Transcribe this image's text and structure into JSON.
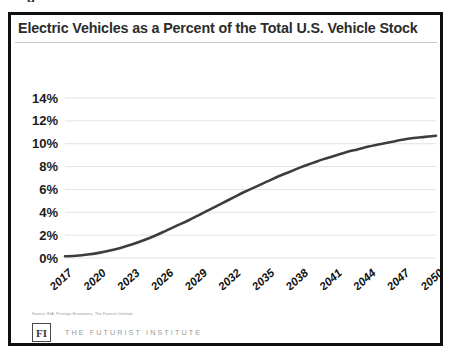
{
  "figure": {
    "top_artifact": "g",
    "title": "Electric Vehicles as a Percent of the Total U.S. Vehicle Stock",
    "source_note": "Source: EIA, Prestige Economics, The Futurist Institute",
    "logo_text": "FI",
    "brand_name": "THE FUTURIST INSTITUTE",
    "line_color": "#3d3d3d",
    "grid_color": "#e3e3e3",
    "border_color": "#101010"
  },
  "chart_data": {
    "type": "line",
    "title": "Electric Vehicles as a Percent of the Total U.S. Vehicle Stock",
    "xlabel": "",
    "ylabel": "",
    "ylim": [
      0,
      14
    ],
    "ytick_labels": [
      "14%",
      "12%",
      "10%",
      "8%",
      "6%",
      "4%",
      "2%",
      "0%"
    ],
    "ytick_values": [
      14,
      12,
      10,
      8,
      6,
      4,
      2,
      0
    ],
    "xtick_labels": [
      "2017",
      "2020",
      "2023",
      "2026",
      "2029",
      "2032",
      "2035",
      "2038",
      "2041",
      "2044",
      "2047",
      "2050"
    ],
    "grid": true,
    "legend": false,
    "series": [
      {
        "name": "EV share of U.S. vehicle stock",
        "x": [
          2017,
          2018,
          2019,
          2020,
          2021,
          2022,
          2023,
          2024,
          2025,
          2026,
          2027,
          2028,
          2029,
          2030,
          2031,
          2032,
          2033,
          2034,
          2035,
          2036,
          2037,
          2038,
          2039,
          2040,
          2041,
          2042,
          2043,
          2044,
          2045,
          2046,
          2047,
          2048,
          2049,
          2050
        ],
        "values": [
          0.15,
          0.2,
          0.3,
          0.45,
          0.65,
          0.9,
          1.2,
          1.55,
          1.95,
          2.4,
          2.85,
          3.3,
          3.8,
          4.3,
          4.8,
          5.3,
          5.8,
          6.25,
          6.7,
          7.15,
          7.55,
          7.95,
          8.3,
          8.65,
          8.95,
          9.25,
          9.5,
          9.75,
          9.95,
          10.15,
          10.35,
          10.5,
          10.6,
          10.7
        ]
      }
    ]
  }
}
